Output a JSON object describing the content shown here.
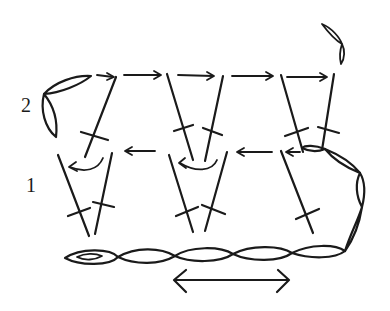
{
  "diagram": {
    "type": "crochet-stitch-chart",
    "row_labels": [
      {
        "text": "2",
        "x": 21,
        "y": 94
      },
      {
        "text": "1",
        "x": 26,
        "y": 174
      }
    ],
    "ink_color": "#1a1a1a",
    "background": "#ffffff",
    "elements": {
      "foundation_chain": "row of chain ovals along bottom with starting slip knot at left",
      "turning_chain_right": "arc of chain ovals from bottom right rising up to row 1",
      "row1_stitches": "3 V-shaped double crochet pairs with crossbars",
      "row2_stitches": "3 V-shaped double crochet pairs with crossbars",
      "direction_arrow_bottom": "double-headed arrow below foundation chain"
    }
  }
}
